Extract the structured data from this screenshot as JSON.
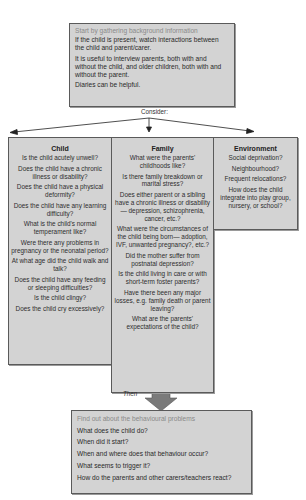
{
  "top_box": {
    "heading": "Start by gathering background information",
    "lines": [
      "If the child is present, watch interactions between the child and parent/carer.",
      "It is useful to interview parents, both with and without the child, and older children, both with and without the parent.",
      "Diaries can be helpful."
    ]
  },
  "connector_top": {
    "label": "Consider:"
  },
  "columns": [
    {
      "title": "Child",
      "questions": [
        "Is the child acutely unwell?",
        "Does the child have a chronic illness or disability?",
        "Does the child have a physical deformity?",
        "Does the child have any learning difficulty?",
        "What is the child's normal temperament like?",
        "Were there any problems in pregnancy or the neonatal period?",
        "At what age did the child walk and talk?",
        "Does the child have any feeding or sleeping difficulties?",
        "Is the child clingy?",
        "Does the child cry excessively?"
      ]
    },
    {
      "title": "Family",
      "questions": [
        "What were the parents' childhoods like?",
        "Is there family breakdown or marital stress?",
        "Does either parent or a sibling have a chronic illness or disability— depression, schizophrenia, cancer, etc.?",
        "What were the circumstances of the child being born— adoption, IVF, unwanted pregnancy?, etc.?",
        "Did the mother suffer from postnatal depression?",
        "Is the child living in care or with short-term foster parents?",
        "Have there been any major losses, e.g. family death or parent leaving?",
        "What are the parents' expectations of the child?"
      ]
    },
    {
      "title": "Environment",
      "questions": [
        "Social deprivation?",
        "Neighbourhood?",
        "Frequent relocations?",
        "How does the child integrate into play group, nursery, or school?"
      ]
    }
  ],
  "connector_bottom": {
    "label": "Then"
  },
  "bottom_box": {
    "heading": "Find out about the behavioural problems",
    "lines": [
      "What does the child do?",
      "When did it start?",
      "When and where does that behaviour occur?",
      "What seems to trigger it?",
      "How do the parents and other carers/teachers react?"
    ]
  },
  "colors": {
    "box_fill": "#d3d3d3",
    "box_border": "#5a5a5a",
    "heading_grey": "#8a8a8a",
    "arrow_grey": "#7a7a7a"
  }
}
